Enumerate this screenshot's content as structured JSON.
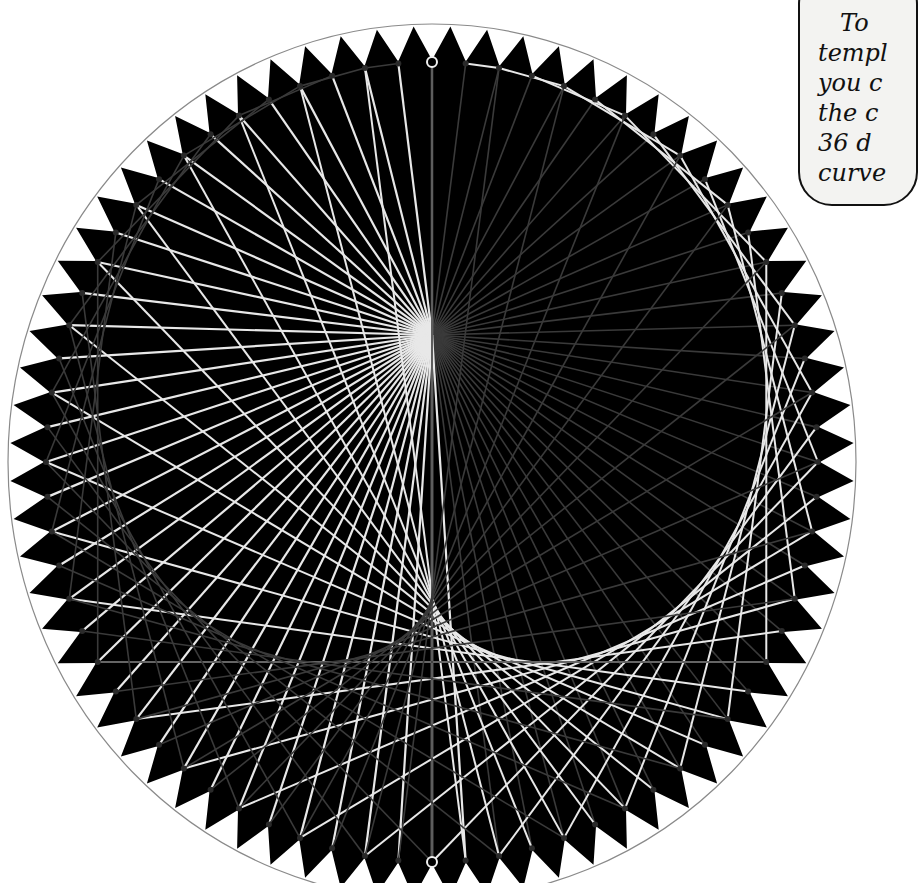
{
  "caption": {
    "lines": [
      "To",
      "templ",
      "you c",
      "the c",
      "36 d",
      "curve"
    ]
  },
  "artwork": {
    "title": "Cardioid string art on toothed circular template",
    "colors": {
      "background": "#ffffff",
      "disc": "#000000",
      "outer_ring": "#8a8a8a",
      "string_light": "#e8e8e8",
      "string_dark": "#3a3a3a",
      "nail": "#2a2a2a",
      "highlight_nail": "#f0f0f0"
    },
    "geometry": {
      "center": [
        432,
        462
      ],
      "outer_radius": [
        424,
        438
      ],
      "tooth_base_radius": [
        388,
        402
      ],
      "nail_radius": [
        386,
        400
      ],
      "cusp": [
        432,
        335
      ],
      "teeth": 72,
      "nails": 72
    }
  }
}
